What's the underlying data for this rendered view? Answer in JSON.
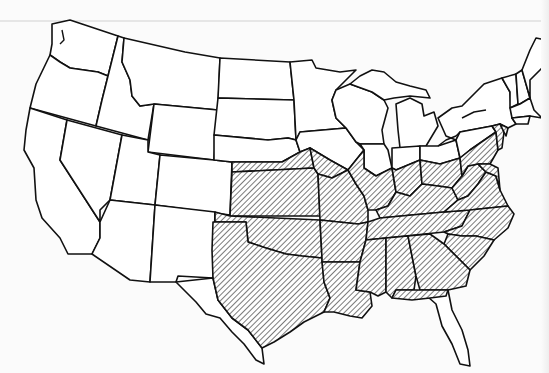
{
  "map": {
    "type": "choropleth-range-map",
    "region": "Contiguous United States",
    "legend": [],
    "title": "",
    "colors": {
      "outline": "#111111",
      "background": "#ffffff",
      "hatch": "#333333"
    },
    "shading_style": "diagonal hatching",
    "shaded_states": [
      "Nebraska (southern portion)",
      "Kansas",
      "Oklahoma",
      "Texas (eastern/central)",
      "Iowa (southern portion)",
      "Missouri",
      "Arkansas",
      "Louisiana",
      "Illinois (southern portion)",
      "Indiana (southern portion)",
      "Ohio (southern portion)",
      "Kentucky",
      "Tennessee",
      "Mississippi",
      "Alabama",
      "Georgia",
      "Florida (panhandle)",
      "South Carolina",
      "North Carolina",
      "Virginia",
      "West Virginia",
      "Maryland",
      "Delaware",
      "Pennsylvania (southern portion)",
      "New Jersey",
      "Connecticut (western portion)"
    ],
    "unshaded_states": [
      "Washington",
      "Oregon",
      "California",
      "Idaho",
      "Nevada",
      "Montana",
      "Wyoming",
      "Utah",
      "Arizona",
      "Colorado",
      "New Mexico",
      "North Dakota",
      "South Dakota",
      "Minnesota",
      "Wisconsin",
      "Michigan",
      "New York",
      "Vermont",
      "New Hampshire",
      "Maine",
      "Massachusetts",
      "Rhode Island",
      "Florida (peninsula)",
      "Texas (western)"
    ]
  }
}
